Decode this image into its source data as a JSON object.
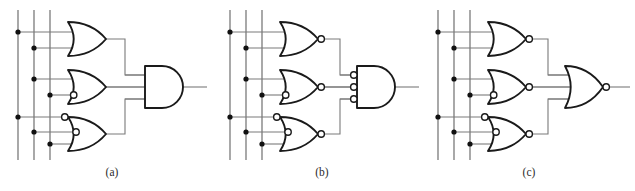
{
  "figure": {
    "background_color": "#ffffff",
    "wire_color": "#7a7a7a",
    "gate_outline_color": "#1a1a1a",
    "junction_color": "#111111",
    "caption_color": "#2b2b2b",
    "width": 635,
    "height": 191
  },
  "panels": [
    {
      "id": "a",
      "caption": "(a)",
      "caption_x": 112,
      "caption_y": 176,
      "origin_x": 0,
      "input_rails": [
        {
          "name": "rail-1",
          "x": 18,
          "y_top": 10,
          "y_bottom": 160
        },
        {
          "name": "rail-2",
          "x": 34,
          "y_top": 10,
          "y_bottom": 160
        },
        {
          "name": "rail-3",
          "x": 50,
          "y_top": 10,
          "y_bottom": 160
        }
      ],
      "junctions": [
        {
          "rail": 1,
          "x": 18,
          "y": 32
        },
        {
          "rail": 2,
          "x": 34,
          "y": 48
        },
        {
          "rail": 2,
          "x": 34,
          "y": 79
        },
        {
          "rail": 3,
          "x": 50,
          "y": 95
        },
        {
          "rail": 1,
          "x": 18,
          "y": 117
        },
        {
          "rail": 2,
          "x": 34,
          "y": 132
        },
        {
          "rail": 3,
          "x": 50,
          "y": 144
        }
      ],
      "gates": [
        {
          "name": "gate-a-or-1",
          "type": "or",
          "shape": "or",
          "output_bubble": false,
          "x": 68,
          "y": 22,
          "w": 38,
          "h": 34,
          "inputs": [
            {
              "y": 32,
              "bubble": false,
              "from_x": 18
            },
            {
              "y": 48,
              "bubble": false,
              "from_x": 34
            }
          ],
          "out_x": 106,
          "out_y": 39
        },
        {
          "name": "gate-a-or-2",
          "type": "or-one-inverted-input",
          "shape": "or",
          "output_bubble": false,
          "x": 68,
          "y": 70,
          "w": 38,
          "h": 34,
          "inputs": [
            {
              "y": 79,
              "bubble": false,
              "from_x": 34
            },
            {
              "y": 95,
              "bubble": true,
              "from_x": 50
            }
          ],
          "out_x": 106,
          "out_y": 87
        },
        {
          "name": "gate-a-or-3",
          "type": "or-two-inverted-inputs",
          "shape": "or",
          "output_bubble": false,
          "x": 68,
          "y": 117,
          "w": 38,
          "h": 34,
          "inputs": [
            {
              "y": 117,
              "bubble": true,
              "from_x": 18
            },
            {
              "y": 132,
              "bubble": true,
              "from_x": 34
            },
            {
              "y": 144,
              "bubble": false,
              "from_x": 50
            }
          ],
          "out_x": 106,
          "out_y": 134
        },
        {
          "name": "gate-a-and-out",
          "type": "and",
          "shape": "and",
          "output_bubble": false,
          "x": 145,
          "y": 66,
          "w": 38,
          "h": 42,
          "inputs": [
            {
              "y": 75,
              "bubble": false,
              "from_x": 125
            },
            {
              "y": 87,
              "bubble": false,
              "from_x": 106
            },
            {
              "y": 99,
              "bubble": false,
              "from_x": 125
            }
          ],
          "out_x": 183,
          "out_y": 87
        }
      ],
      "interconnects": [
        {
          "name": "wire-a-g1-to-and",
          "points": "106,39 125,39 125,75 145,75"
        },
        {
          "name": "wire-a-g2-to-and",
          "points": "106,87 145,87"
        },
        {
          "name": "wire-a-g3-to-and",
          "points": "106,134 125,134 125,99 145,99"
        }
      ],
      "output_wire": {
        "name": "output-a",
        "points": "183,87 207,87"
      }
    },
    {
      "id": "b",
      "caption": "(b)",
      "caption_x": 322,
      "caption_y": 176,
      "origin_x": 212,
      "input_rails": [
        {
          "name": "rail-1",
          "x": 230,
          "y_top": 10,
          "y_bottom": 160
        },
        {
          "name": "rail-2",
          "x": 246,
          "y_top": 10,
          "y_bottom": 160
        },
        {
          "name": "rail-3",
          "x": 262,
          "y_top": 10,
          "y_bottom": 160
        }
      ],
      "junctions": [
        {
          "rail": 1,
          "x": 230,
          "y": 32
        },
        {
          "rail": 2,
          "x": 246,
          "y": 48
        },
        {
          "rail": 2,
          "x": 246,
          "y": 79
        },
        {
          "rail": 3,
          "x": 262,
          "y": 95
        },
        {
          "rail": 1,
          "x": 230,
          "y": 117
        },
        {
          "rail": 2,
          "x": 246,
          "y": 132
        },
        {
          "rail": 3,
          "x": 262,
          "y": 144
        }
      ],
      "gates": [
        {
          "name": "gate-b-nor-1",
          "type": "nor",
          "shape": "or",
          "output_bubble": true,
          "x": 280,
          "y": 22,
          "w": 38,
          "h": 34,
          "inputs": [
            {
              "y": 32,
              "bubble": false,
              "from_x": 230
            },
            {
              "y": 48,
              "bubble": false,
              "from_x": 246
            }
          ],
          "out_x": 318,
          "out_y": 39
        },
        {
          "name": "gate-b-nor-2",
          "type": "nor-one-inverted-input",
          "shape": "or",
          "output_bubble": true,
          "x": 280,
          "y": 70,
          "w": 38,
          "h": 34,
          "inputs": [
            {
              "y": 79,
              "bubble": false,
              "from_x": 246
            },
            {
              "y": 95,
              "bubble": true,
              "from_x": 262
            }
          ],
          "out_x": 318,
          "out_y": 87
        },
        {
          "name": "gate-b-nor-3",
          "type": "nor-two-inverted-inputs",
          "shape": "or",
          "output_bubble": true,
          "x": 280,
          "y": 117,
          "w": 38,
          "h": 34,
          "inputs": [
            {
              "y": 117,
              "bubble": true,
              "from_x": 230
            },
            {
              "y": 132,
              "bubble": true,
              "from_x": 246
            },
            {
              "y": 144,
              "bubble": false,
              "from_x": 262
            }
          ],
          "out_x": 318,
          "out_y": 134
        },
        {
          "name": "gate-b-and-out",
          "type": "and-three-inverted-inputs",
          "shape": "and",
          "output_bubble": false,
          "x": 357,
          "y": 66,
          "w": 38,
          "h": 42,
          "inputs": [
            {
              "y": 75,
              "bubble": true,
              "from_x": 340
            },
            {
              "y": 87,
              "bubble": true,
              "from_x": 325
            },
            {
              "y": 99,
              "bubble": true,
              "from_x": 340
            }
          ],
          "out_x": 395,
          "out_y": 87
        }
      ],
      "interconnects": [
        {
          "name": "wire-b-g1-to-and",
          "points": "325,39 340,39 340,75 352,75"
        },
        {
          "name": "wire-b-g2-to-and",
          "points": "325,87 352,87"
        },
        {
          "name": "wire-b-g3-to-and",
          "points": "325,134 340,134 340,99 352,99"
        }
      ],
      "output_wire": {
        "name": "output-b",
        "points": "395,87 419,87"
      }
    },
    {
      "id": "c",
      "caption": "(c)",
      "caption_x": 529,
      "caption_y": 176,
      "origin_x": 420,
      "input_rails": [
        {
          "name": "rail-1",
          "x": 438,
          "y_top": 10,
          "y_bottom": 160
        },
        {
          "name": "rail-2",
          "x": 454,
          "y_top": 10,
          "y_bottom": 160
        },
        {
          "name": "rail-3",
          "x": 470,
          "y_top": 10,
          "y_bottom": 160
        }
      ],
      "junctions": [
        {
          "rail": 1,
          "x": 438,
          "y": 32
        },
        {
          "rail": 2,
          "x": 454,
          "y": 48
        },
        {
          "rail": 2,
          "x": 454,
          "y": 79
        },
        {
          "rail": 3,
          "x": 470,
          "y": 95
        },
        {
          "rail": 1,
          "x": 438,
          "y": 117
        },
        {
          "rail": 2,
          "x": 454,
          "y": 132
        },
        {
          "rail": 3,
          "x": 470,
          "y": 144
        }
      ],
      "gates": [
        {
          "name": "gate-c-nor-1",
          "type": "nor",
          "shape": "or",
          "output_bubble": true,
          "x": 488,
          "y": 22,
          "w": 38,
          "h": 34,
          "inputs": [
            {
              "y": 32,
              "bubble": false,
              "from_x": 438
            },
            {
              "y": 48,
              "bubble": false,
              "from_x": 454
            }
          ],
          "out_x": 526,
          "out_y": 39
        },
        {
          "name": "gate-c-nor-2",
          "type": "nor-one-inverted-input",
          "shape": "or",
          "output_bubble": true,
          "x": 488,
          "y": 70,
          "w": 38,
          "h": 34,
          "inputs": [
            {
              "y": 79,
              "bubble": false,
              "from_x": 454
            },
            {
              "y": 95,
              "bubble": true,
              "from_x": 470
            }
          ],
          "out_x": 526,
          "out_y": 87
        },
        {
          "name": "gate-c-nor-3",
          "type": "nor-two-inverted-inputs",
          "shape": "or",
          "output_bubble": true,
          "x": 488,
          "y": 117,
          "w": 38,
          "h": 34,
          "inputs": [
            {
              "y": 117,
              "bubble": true,
              "from_x": 438
            },
            {
              "y": 132,
              "bubble": true,
              "from_x": 454
            },
            {
              "y": 144,
              "bubble": false,
              "from_x": 470
            }
          ],
          "out_x": 526,
          "out_y": 134
        },
        {
          "name": "gate-c-nor-out",
          "type": "nor",
          "shape": "or",
          "output_bubble": true,
          "x": 565,
          "y": 66,
          "w": 38,
          "h": 42,
          "inputs": [
            {
              "y": 75,
              "bubble": false,
              "from_x": 548
            },
            {
              "y": 87,
              "bubble": false,
              "from_x": 533
            },
            {
              "y": 99,
              "bubble": false,
              "from_x": 548
            }
          ],
          "out_x": 603,
          "out_y": 87
        }
      ],
      "interconnects": [
        {
          "name": "wire-c-g1-to-nor",
          "points": "533,39 548,39 548,75 570,75"
        },
        {
          "name": "wire-c-g2-to-nor",
          "points": "533,87 570,87"
        },
        {
          "name": "wire-c-g3-to-nor",
          "points": "533,134 548,134 548,99 570,99"
        }
      ],
      "output_wire": {
        "name": "output-c",
        "points": "609,87 630,87"
      }
    }
  ],
  "style": {
    "bubble_radius": 3.2,
    "junction_radius": 2.6,
    "input_stub_overlap": 4
  }
}
